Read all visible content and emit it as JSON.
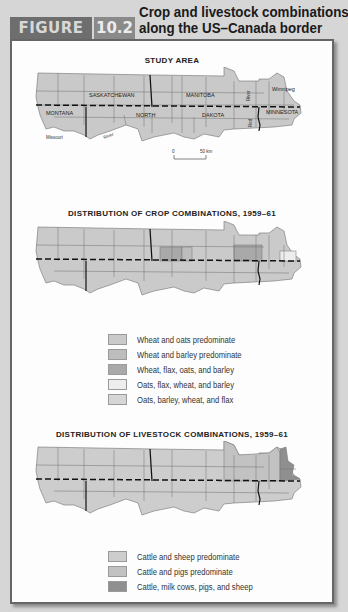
{
  "figure": {
    "tag": "FIGURE",
    "number": "10.2",
    "title_line1": "Crop and livestock combinations",
    "title_line2": "along the US–Canada border"
  },
  "colors": {
    "page_bg": "#d6d6d6",
    "figure_tab": "#6e6e6e",
    "number_tab": "#8a8a8a",
    "panel_border": "#666666",
    "region_default": "#c9c9c9",
    "region_outline": "#707070",
    "border_line": "#111111"
  },
  "maps": [
    {
      "id": "study-area",
      "title": "STUDY AREA",
      "labels": {
        "saskatchewan": "SASKATCHEWAN",
        "manitoba": "MANITOBA",
        "winnipeg": "Winnipeg",
        "montana": "MONTANA",
        "north": "NORTH",
        "dakota": "DAKOTA",
        "minnesota": "MINNESOTA",
        "red": "Red",
        "river_red": "River",
        "missouri": "Missouri",
        "river_missouri": "River"
      },
      "scale_bar": {
        "start": "0",
        "end": "50 km"
      }
    },
    {
      "id": "crop-combinations",
      "title": "DISTRIBUTION OF CROP COMBINATIONS, 1959–61",
      "legend": [
        {
          "label": "Wheat and oats predominate",
          "color": "#cacaca"
        },
        {
          "label": "Wheat and barley predominate",
          "color": "#bdbdbd"
        },
        {
          "label": "Wheat, flax, oats, and barley",
          "color": "#a9a9a9"
        },
        {
          "label": "Oats, flax, wheat, and barley",
          "color": "#ededed"
        },
        {
          "label": "Oats, barley, wheat, and flax",
          "color": "#d6d6d6"
        }
      ]
    },
    {
      "id": "livestock-combinations",
      "title": "DISTRIBUTION OF LIVESTOCK COMBINATIONS, 1959–61",
      "legend": [
        {
          "label": "Cattle and sheep predominate",
          "color": "#cdcdcd"
        },
        {
          "label": "Cattle and pigs predominate",
          "color": "#c2c2c2"
        },
        {
          "label": "Cattle, milk cows, pigs, and sheep",
          "color": "#8f8f8f"
        }
      ]
    }
  ]
}
